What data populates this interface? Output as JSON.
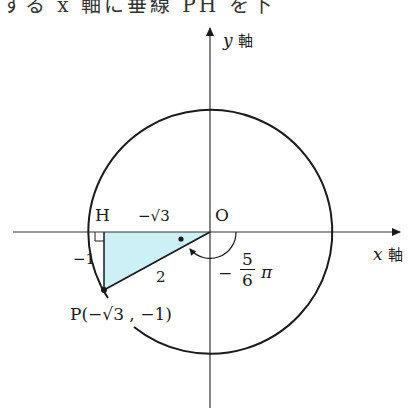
{
  "header": {
    "cropped_text": "する x 軸に垂線 PH を下"
  },
  "axes": {
    "x_label_var": "x",
    "x_label_kanji": "軸",
    "y_label_var": "y",
    "y_label_kanji": "軸"
  },
  "points": {
    "origin": "O",
    "foot": "H",
    "p_label": "P(−√3 , −1)"
  },
  "segment_labels": {
    "OH": "−√3",
    "HP": "−1",
    "OP": "2"
  },
  "angle": {
    "sign": "−",
    "numerator": "5",
    "denominator": "6",
    "symbol": "π"
  },
  "colors": {
    "triangle_fill": "#cdeff6",
    "stroke": "#1a1a1a",
    "axis": "#333333"
  }
}
